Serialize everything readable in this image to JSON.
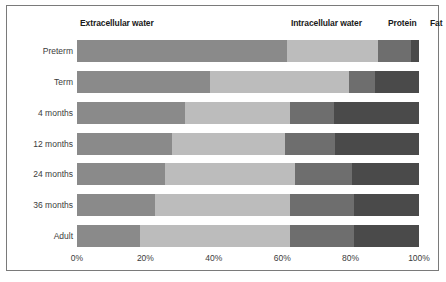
{
  "chart_data": {
    "type": "bar",
    "orientation": "horizontal",
    "stacked": true,
    "normalized": true,
    "title": "",
    "xlabel": "",
    "ylabel": "",
    "xlim": [
      0,
      100
    ],
    "xticks": [
      "0%",
      "20%",
      "40%",
      "60%",
      "80%",
      "100%"
    ],
    "xtick_values": [
      0,
      20,
      40,
      60,
      80,
      100
    ],
    "grid": false,
    "legend_position": "top",
    "categories": [
      "Preterm",
      "Term",
      "4 months",
      "12 months",
      "24 months",
      "36 months",
      "Adult"
    ],
    "series": [
      {
        "name": "Extracellular water",
        "color": "#8a8a8a",
        "values": [
          61.4,
          38.9,
          31.6,
          27.8,
          25.7,
          22.8,
          18.4
        ]
      },
      {
        "name": "Intracellular water",
        "color": "#bcbcbc",
        "values": [
          26.6,
          40.6,
          30.7,
          33.0,
          38.0,
          39.5,
          43.9
        ]
      },
      {
        "name": "Protein",
        "color": "#6e6e6e",
        "values": [
          9.6,
          7.6,
          12.9,
          14.6,
          16.7,
          18.7,
          18.7
        ]
      },
      {
        "name": "Fat",
        "color": "#4a4a4a",
        "values": [
          2.4,
          12.9,
          24.8,
          24.6,
          19.6,
          19.0,
          19.0
        ]
      }
    ]
  },
  "legend": {
    "extracellular_water": "Extracellular water",
    "intracellular_water": "Intracellular water",
    "protein": "Protein",
    "fat": "Fat"
  },
  "colors": {
    "extracellular_water": "#8a8a8a",
    "intracellular_water": "#bcbcbc",
    "protein": "#6e6e6e",
    "fat": "#4a4a4a",
    "frame_border": "#7a7a7a",
    "label_text": "#3b3b3b",
    "header_text": "#1a1a1a",
    "background": "#ffffff"
  }
}
